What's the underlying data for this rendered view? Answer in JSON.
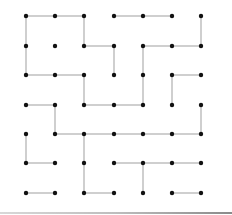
{
  "diagram": {
    "type": "dot-grid-maze",
    "grid": {
      "cols": 7,
      "rows": 7
    },
    "col_x": [
      26,
      55,
      84,
      114,
      143,
      172,
      201
    ],
    "row_y": [
      16,
      46,
      75,
      105,
      134,
      163,
      193
    ],
    "colors": {
      "dot": "#111111",
      "edge": "#b5b5b5",
      "background": "#ffffff"
    },
    "horizontal_edges": [
      [
        0,
        0,
        1
      ],
      [
        0,
        1,
        2
      ],
      [
        0,
        3,
        4
      ],
      [
        0,
        4,
        5
      ],
      [
        1,
        2,
        3
      ],
      [
        1,
        4,
        5
      ],
      [
        1,
        5,
        6
      ],
      [
        2,
        0,
        1
      ],
      [
        2,
        1,
        2
      ],
      [
        2,
        5,
        6
      ],
      [
        3,
        0,
        1
      ],
      [
        3,
        2,
        3
      ],
      [
        3,
        3,
        4
      ],
      [
        4,
        1,
        2
      ],
      [
        4,
        2,
        3
      ],
      [
        4,
        3,
        4
      ],
      [
        4,
        4,
        5
      ],
      [
        4,
        5,
        6
      ],
      [
        5,
        0,
        1
      ],
      [
        5,
        3,
        4
      ],
      [
        5,
        4,
        5
      ],
      [
        5,
        5,
        6
      ],
      [
        6,
        0,
        1
      ],
      [
        6,
        2,
        3
      ],
      [
        6,
        5,
        6
      ]
    ],
    "vertical_edges": [
      [
        0,
        0,
        1
      ],
      [
        2,
        0,
        1
      ],
      [
        6,
        0,
        1
      ],
      [
        0,
        1,
        2
      ],
      [
        3,
        1,
        2
      ],
      [
        4,
        1,
        2
      ],
      [
        2,
        2,
        3
      ],
      [
        4,
        2,
        3
      ],
      [
        5,
        2,
        3
      ],
      [
        1,
        3,
        4
      ],
      [
        6,
        3,
        4
      ],
      [
        0,
        4,
        5
      ],
      [
        2,
        4,
        5
      ],
      [
        2,
        5,
        6
      ],
      [
        4,
        5,
        6
      ]
    ]
  }
}
